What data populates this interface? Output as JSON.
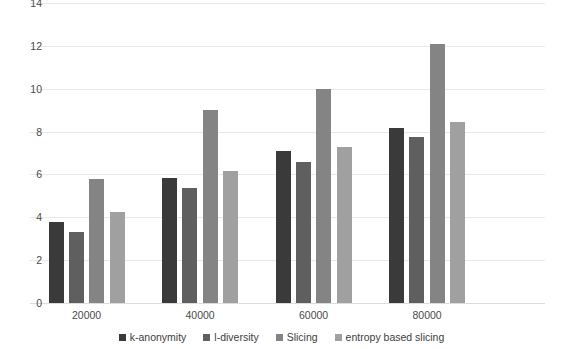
{
  "chart_data": {
    "type": "bar",
    "title": "",
    "xlabel": "",
    "ylabel": "",
    "categories": [
      "20000",
      "40000",
      "60000",
      "80000"
    ],
    "series": [
      {
        "name": "k-anonymity",
        "color": "#3a3a3a",
        "values": [
          3.8,
          5.85,
          7.1,
          8.15
        ]
      },
      {
        "name": "l-diversity",
        "color": "#5f5f5f",
        "values": [
          3.3,
          5.35,
          6.6,
          7.75
        ]
      },
      {
        "name": "Slicing",
        "color": "#848484",
        "values": [
          5.8,
          9.0,
          10.0,
          12.1
        ]
      },
      {
        "name": "entropy based slicing",
        "color": "#a0a0a0",
        "values": [
          4.25,
          6.15,
          7.3,
          8.45
        ]
      }
    ],
    "ylim": [
      0,
      14
    ],
    "y_ticks": [
      0,
      2,
      4,
      6,
      8,
      10,
      12,
      14
    ],
    "y_tick_labels": [
      "0",
      "2",
      "4",
      "6",
      "8",
      "10",
      "12",
      "14"
    ],
    "grid": true,
    "legend_position": "bottom"
  }
}
